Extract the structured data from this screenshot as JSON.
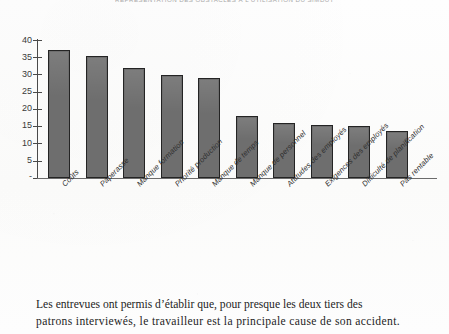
{
  "figure": {
    "title": "REPRÉSENTATION DES OBSTACLES À L'UTILISATION DU SIMDUT"
  },
  "chart_data": {
    "type": "bar",
    "title": "REPRÉSENTATION DES OBSTACLES À L'UTILISATION DU SIMDUT",
    "xlabel": "",
    "ylabel": "",
    "ylim": [
      0,
      40
    ],
    "yticks": [
      "-",
      "5",
      "10",
      "15",
      "20",
      "25",
      "30",
      "35",
      "40"
    ],
    "ytick_values": [
      0,
      5,
      10,
      15,
      20,
      25,
      30,
      35,
      40
    ],
    "grid": false,
    "legend": false,
    "bar_color": "#6e6e6e",
    "bar_edge_color": "#242424",
    "categories": [
      "Coûts",
      "Paperasse",
      "Manque formation",
      "Priorité production",
      "Manque de temps",
      "Manque de personnel",
      "Attitudes des employés",
      "Exigences des employés",
      "Difficulté de planification",
      "Pas rentable"
    ],
    "values": [
      37,
      35.5,
      32,
      30,
      29,
      18,
      16,
      15.5,
      15,
      13.5
    ]
  },
  "body": {
    "line1": "Les entrevues ont permis d’établir que, pour presque les deux tiers des",
    "line2": "patrons interviewés, le travailleur est la principale cause de son accident."
  }
}
